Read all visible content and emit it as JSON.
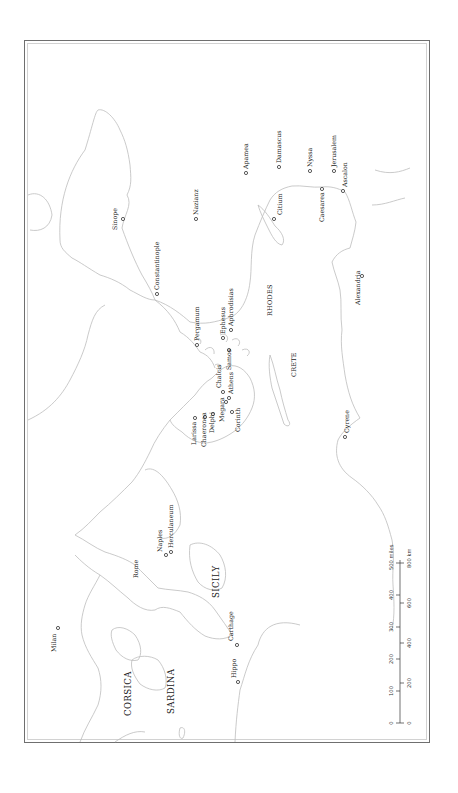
{
  "map": {
    "orientation": "rotated 90° counter-clockwise (north points left)",
    "regions": [
      {
        "id": "corsica",
        "label": "CORSICA"
      },
      {
        "id": "sardina",
        "label": "SARDINA"
      },
      {
        "id": "sicily",
        "label": "SICILY"
      },
      {
        "id": "crete",
        "label": "CRETE"
      },
      {
        "id": "rhodes",
        "label": "RHODES"
      }
    ],
    "cities": [
      {
        "id": "milan",
        "label": "Milan"
      },
      {
        "id": "rome",
        "label": "Rome"
      },
      {
        "id": "naples",
        "label": "Naples"
      },
      {
        "id": "herculaneum",
        "label": "Herculaneum"
      },
      {
        "id": "carthage",
        "label": "Carthage"
      },
      {
        "id": "hippo",
        "label": "Hippo"
      },
      {
        "id": "larissa",
        "label": "Larissa"
      },
      {
        "id": "chaeronea",
        "label": "Chaeronea"
      },
      {
        "id": "delphi",
        "label": "Delphi"
      },
      {
        "id": "megara",
        "label": "Megara"
      },
      {
        "id": "corinth",
        "label": "Corinth"
      },
      {
        "id": "athens",
        "label": "Athens"
      },
      {
        "id": "chalcis",
        "label": "Chalcis"
      },
      {
        "id": "samos",
        "label": "Samos"
      },
      {
        "id": "ephesus",
        "label": "Ephesus"
      },
      {
        "id": "aphrodisias",
        "label": "Aphrodisias"
      },
      {
        "id": "pergamum",
        "label": "Pergamum"
      },
      {
        "id": "constantinople",
        "label": "Constantinople"
      },
      {
        "id": "sinope",
        "label": "Sinope"
      },
      {
        "id": "nazianz",
        "label": "Nazianz"
      },
      {
        "id": "cyrene",
        "label": "Cyrene"
      },
      {
        "id": "alexandria",
        "label": "Alexandria"
      },
      {
        "id": "citium",
        "label": "Citium"
      },
      {
        "id": "apamea",
        "label": "Apamea"
      },
      {
        "id": "damascus",
        "label": "Damascus"
      },
      {
        "id": "nyssa",
        "label": "Nyssa"
      },
      {
        "id": "caesarea",
        "label": "Caesarea"
      },
      {
        "id": "jerusalem",
        "label": "Jerusalem"
      },
      {
        "id": "ascalon",
        "label": "Ascalon"
      }
    ],
    "scale_bar": {
      "miles": {
        "ticks": [
          "0",
          "100",
          "200",
          "300",
          "400",
          "500 miles"
        ]
      },
      "km": {
        "ticks": [
          "0",
          "200",
          "400",
          "600",
          "800 km"
        ]
      }
    }
  }
}
